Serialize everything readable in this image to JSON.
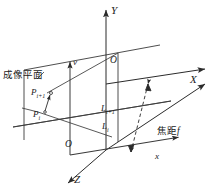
{
  "figure": {
    "type": "technical-line-diagram",
    "background_color": "#ffffff",
    "line_color": "#2b2b2b",
    "text_color": "#1a1a1a"
  },
  "labels": {
    "world_axis_x": "X",
    "world_axis_y": "Y",
    "world_axis_z": "Z",
    "world_origin": "O",
    "image_axis_x": "x",
    "image_axis_v": "v",
    "image_origin": "O",
    "point_upper": "P",
    "point_upper_sub": "i+1",
    "point_lower": "P",
    "point_lower_sub": "i",
    "line_upper": "L",
    "line_upper_sub": "i+1",
    "line_lower": "L",
    "line_lower_sub": "i",
    "image_plane": "成像平面",
    "focal_length_cjk": "焦距",
    "focal_length_sym": "f"
  }
}
